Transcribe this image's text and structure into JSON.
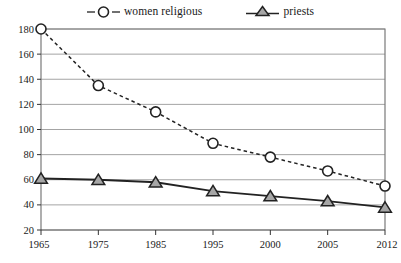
{
  "chart_data": {
    "type": "line",
    "title": "",
    "subtitle": "",
    "xlabel": "",
    "ylabel": "",
    "categories": [
      "1965",
      "1975",
      "1985",
      "1995",
      "2000",
      "2005",
      "2012"
    ],
    "series": [
      {
        "name": "women religious",
        "marker": "circle-open",
        "line_style": "dashed",
        "color": "#222222",
        "values": [
          180,
          135,
          114,
          89,
          78,
          67,
          55
        ]
      },
      {
        "name": "priests",
        "marker": "triangle-filled",
        "line_style": "solid",
        "color": "#222222",
        "marker_fill": "#a6a6a6",
        "values": [
          61,
          60,
          58,
          51,
          47,
          43,
          38
        ]
      }
    ],
    "ylim": [
      20,
      180
    ],
    "yticks": [
      20,
      40,
      60,
      80,
      100,
      120,
      140,
      160,
      180
    ],
    "ytick_labels": [
      "20",
      "40",
      "60",
      "80",
      "100",
      "120",
      "140",
      "160",
      "180"
    ],
    "grid": true,
    "grid_axis": "y",
    "grid_color": "#9a9a9a",
    "legend_position": "top-center",
    "frame_color": "#7a7a7a",
    "background": "#ffffff"
  },
  "legend": {
    "items": [
      {
        "label": "women religious"
      },
      {
        "label": "priests"
      }
    ]
  }
}
